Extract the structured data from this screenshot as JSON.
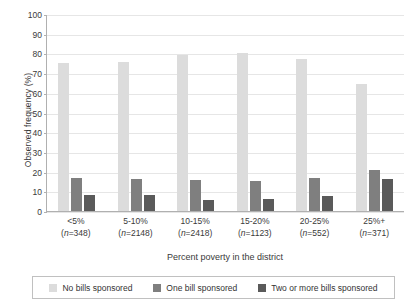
{
  "chart_data": {
    "type": "bar",
    "title": "",
    "xlabel": "Percent poverty in the district",
    "ylabel": "Observed frequency (%)",
    "ylim": [
      0,
      100
    ],
    "ytick_step": 10,
    "yticks": [
      "100",
      "90",
      "80",
      "70",
      "60",
      "50",
      "40",
      "30",
      "20",
      "10",
      "0"
    ],
    "grid": true,
    "legend_position": "bottom",
    "categories": [
      "<5%",
      "5-10%",
      "10-15%",
      "15-20%",
      "20-25%",
      "25%+"
    ],
    "category_counts": [
      "(n=348)",
      "(n=2148)",
      "(n=2418)",
      "(n=1123)",
      "(n=552)",
      "(n=371)"
    ],
    "series": [
      {
        "name": "No bills sponsored",
        "color": "#dcdcdc",
        "values": [
          75,
          75.5,
          79,
          80,
          77,
          64.5
        ]
      },
      {
        "name": "One bill sponsored",
        "color": "#7f7f7f",
        "values": [
          17,
          16.5,
          15.5,
          15,
          17,
          21
        ]
      },
      {
        "name": "Two or more bills sponsored",
        "color": "#5a5a5a",
        "values": [
          8,
          8,
          5.5,
          6,
          7.5,
          16.5
        ]
      }
    ]
  }
}
